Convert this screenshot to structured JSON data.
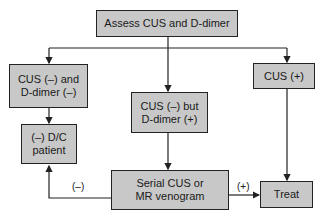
{
  "diagram": {
    "type": "flowchart",
    "nodes": {
      "assess": {
        "line1": "Assess CUS and D-dimer"
      },
      "both_negative": {
        "line1": "CUS (–) and",
        "line2": "D-dimer (–)"
      },
      "discharge": {
        "line1": "(–) D/C",
        "line2": "patient"
      },
      "ddimer_positive": {
        "line1": "CUS (–) but",
        "line2": "D-dimer (+)"
      },
      "cus_positive": {
        "line1": "CUS (+)"
      },
      "serial": {
        "line1": "Serial CUS or",
        "line2": "MR venogram"
      },
      "treat": {
        "line1": "Treat"
      }
    },
    "edge_labels": {
      "negative": "(–)",
      "positive": "(+)"
    },
    "colors": {
      "box_fill": "#c8c8c8",
      "stroke": "#222222"
    }
  }
}
